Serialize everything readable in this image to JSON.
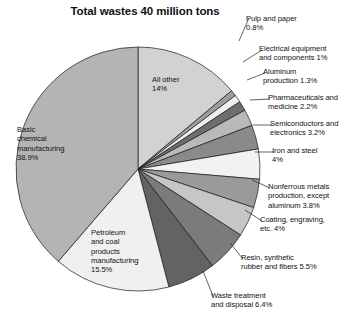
{
  "chart_data": {
    "type": "pie",
    "title": "Total wastes 40 million tons",
    "xlabel": "",
    "ylabel": "",
    "legend_position": "callout-labels",
    "grid": false,
    "units": "percent of 40 million tons",
    "start_angle_deg": 0,
    "direction": "clockwise",
    "categories": [
      "All other",
      "Pulp and paper",
      "Electrical equipment and components",
      "Aluminum production",
      "Pharmaceuticals and medicine",
      "Semiconductors and electronics",
      "Iron and steel",
      "Nonferrous metals production, except aluminum",
      "Coating, engraving, etc.",
      "Resin, synthetic rubber and fibers",
      "Waste treatment and disposal",
      "Petroleum and coal products manufacturing",
      "Basic chemical manufacturing"
    ],
    "values": [
      14,
      0.8,
      1,
      1.3,
      2.2,
      3.2,
      4,
      3.8,
      4,
      5.5,
      6.4,
      15.5,
      38.9
    ],
    "slice_colors": [
      "#d2d2d2",
      "#9d9d9d",
      "#efefef",
      "#6e6e6e",
      "#b9b9b9",
      "#8a8a8a",
      "#f2f2f2",
      "#9a9a9a",
      "#c6c6c6",
      "#7b7b7b",
      "#636363",
      "#f0f0f0",
      "#b4b4b4"
    ],
    "slice_label_texts": [
      "All other\n14%",
      "Pulp and paper\n0.8%",
      "Electrical equipment\nand components 1%",
      "Aluminum\nproduction 1.3%",
      "Pharmaceuticals and\nmedicine 2.2%",
      "Semiconductors and\nelectronics 3.2%",
      "Iron and steel\n4%",
      "Nonferrous metals\nproduction, except\naluminum 3.8%",
      "Coating, engraving,\netc. 4%",
      "Resin, synthetic\nrubber and fibers 5.5%",
      "Waste treatment\nand disposal 6.4%",
      "Petroleum\nand coal\nproducts\nmanufacturing\n15.5%",
      "Basic\nchemical\nmanufacturing\n38.9%"
    ]
  },
  "labels": {
    "all_other": "All other\n14%",
    "pulp_and_paper": "Pulp and paper\n0.8%",
    "electrical_equipment": "Electrical equipment\nand components 1%",
    "aluminum": "Aluminum\nproduction 1.3%",
    "pharmaceuticals": "Pharmaceuticals and\nmedicine 2.2%",
    "semiconductors": "Semiconductors and\nelectronics 3.2%",
    "iron_and_steel": "Iron and steel\n4%",
    "nonferrous_metals": "Nonferrous metals\nproduction, except\naluminum 3.8%",
    "coating_engraving": "Coating, engraving,\netc. 4%",
    "resin_rubber_fibers": "Resin, synthetic\nrubber and fibers 5.5%",
    "waste_treatment": "Waste treatment\nand disposal 6.4%",
    "petroleum_coal": "Petroleum\nand coal\nproducts\nmanufacturing\n15.5%",
    "basic_chemical": "Basic\nchemical\nmanufacturing\n38.9%"
  }
}
